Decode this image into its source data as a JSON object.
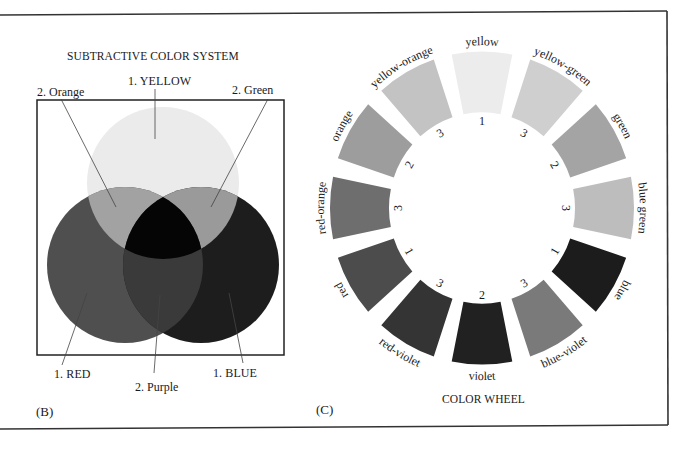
{
  "panel_b": {
    "title": "SUBTRACTIVE COLOR SYSTEM",
    "panel_letter": "(B)",
    "labels": {
      "yellow": "1. YELLOW",
      "orange": "2. Orange",
      "green": "2. Green",
      "red": "1. RED",
      "purple": "2. Purple",
      "blue": "1. BLUE"
    },
    "circles": [
      {
        "name": "yellow",
        "cx": 163,
        "cy": 183,
        "r": 76,
        "color": "#ebebeb"
      },
      {
        "name": "red",
        "cx": 125,
        "cy": 265,
        "r": 78,
        "color": "#4f4f4f"
      },
      {
        "name": "blue",
        "cx": 201,
        "cy": 265,
        "r": 78,
        "color": "#1d1d1d"
      }
    ],
    "overlap_colors": {
      "orange": "#a2a2a2",
      "green": "#9a9a9a",
      "purple": "#3a3a3a",
      "center": "#050505"
    }
  },
  "panel_c": {
    "title": "COLOR WHEEL",
    "panel_letter": "(C)",
    "segments": [
      {
        "label": "yellow",
        "number": "1",
        "color": "#ececec"
      },
      {
        "label": "yellow-green",
        "number": "3",
        "color": "#cfcfcf"
      },
      {
        "label": "green",
        "number": "2",
        "color": "#a4a4a4"
      },
      {
        "label": "blue green",
        "number": "3",
        "color": "#bdbdbd"
      },
      {
        "label": "blue",
        "number": "1",
        "color": "#1c1c1c"
      },
      {
        "label": "blue-violet",
        "number": "3",
        "color": "#7a7a7a"
      },
      {
        "label": "violet",
        "number": "2",
        "color": "#212121"
      },
      {
        "label": "red-violet",
        "number": "3",
        "color": "#343434"
      },
      {
        "label": "red",
        "number": "1",
        "color": "#4c4c4c"
      },
      {
        "label": "red-orange",
        "number": "3",
        "color": "#6e6e6e"
      },
      {
        "label": "orange",
        "number": "2",
        "color": "#9d9d9d"
      },
      {
        "label": "yellow-orange",
        "number": "3",
        "color": "#c3c3c3"
      }
    ]
  },
  "chart_data": {
    "type": "diagram",
    "diagrams": [
      {
        "title": "SUBTRACTIVE COLOR SYSTEM",
        "kind": "venn",
        "primaries": [
          "1. YELLOW",
          "1. RED",
          "1. BLUE"
        ],
        "secondaries": [
          "2. Orange",
          "2. Green",
          "2. Purple"
        ]
      },
      {
        "title": "COLOR WHEEL",
        "kind": "wheel",
        "order_clockwise_from_top": [
          "yellow",
          "yellow-green",
          "green",
          "blue green",
          "blue",
          "blue-violet",
          "violet",
          "red-violet",
          "red",
          "red-orange",
          "orange",
          "yellow-orange"
        ],
        "numbers": [
          "1",
          "3",
          "2",
          "3",
          "1",
          "3",
          "2",
          "3",
          "1",
          "3",
          "2",
          "3"
        ]
      }
    ]
  }
}
